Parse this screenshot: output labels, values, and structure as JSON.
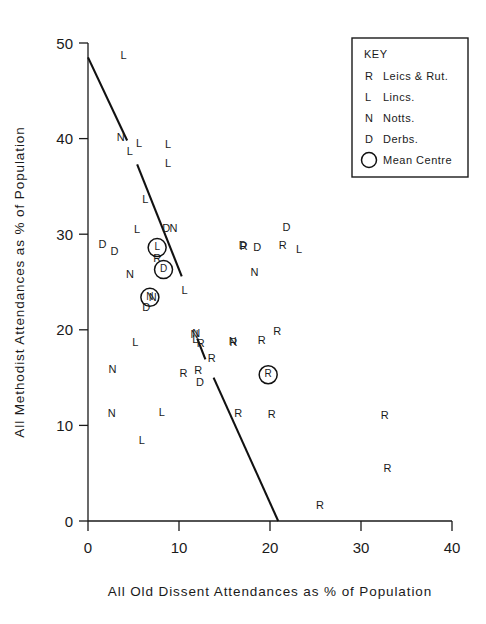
{
  "chart_data": {
    "type": "scatter",
    "title": "",
    "xlabel": "All Old Dissent Attendances as % of Population",
    "ylabel": "All Methodist Attendances as % of Population",
    "xlim": [
      0,
      40
    ],
    "ylim": [
      0,
      50
    ],
    "xticks": [
      0,
      10,
      20,
      30,
      40
    ],
    "yticks": [
      0,
      10,
      20,
      30,
      40,
      50
    ],
    "xtick_labels": [
      "0",
      "10",
      "20",
      "30",
      "40"
    ],
    "ytick_labels": [
      "0",
      "10",
      "20",
      "30",
      "40",
      "50"
    ],
    "grid": false,
    "marker_style": "letter-coded by county",
    "series": [
      {
        "name": "Leics & Rut.",
        "code": "R",
        "points": [
          [
            7.6,
            27.4
          ],
          [
            17.1,
            28.6
          ],
          [
            21.4,
            28.8
          ],
          [
            13.6,
            16.9
          ],
          [
            16.0,
            18.6
          ],
          [
            19.1,
            18.8
          ],
          [
            20.8,
            19.8
          ],
          [
            12.1,
            15.7
          ],
          [
            12.4,
            18.5
          ],
          [
            10.5,
            15.4
          ],
          [
            16.5,
            11.2
          ],
          [
            20.2,
            11.1
          ],
          [
            32.6,
            11.0
          ],
          [
            32.9,
            5.4
          ],
          [
            25.5,
            1.6
          ]
        ]
      },
      {
        "name": "Lincs.",
        "code": "L",
        "points": [
          [
            3.9,
            48.6
          ],
          [
            4.6,
            38.6
          ],
          [
            5.6,
            39.4
          ],
          [
            8.8,
            39.3
          ],
          [
            8.8,
            37.3
          ],
          [
            6.3,
            33.6
          ],
          [
            5.4,
            30.4
          ],
          [
            10.6,
            24.1
          ],
          [
            23.2,
            28.3
          ],
          [
            5.2,
            18.6
          ],
          [
            11.8,
            18.9
          ],
          [
            8.1,
            11.3
          ],
          [
            5.9,
            8.4
          ]
        ]
      },
      {
        "name": "Notts.",
        "code": "N",
        "points": [
          [
            3.6,
            40.1
          ],
          [
            9.4,
            30.5
          ],
          [
            4.6,
            25.7
          ],
          [
            7.1,
            23.3
          ],
          [
            18.3,
            25.9
          ],
          [
            11.9,
            19.5
          ],
          [
            2.7,
            15.8
          ],
          [
            2.6,
            11.2
          ],
          [
            11.7,
            19.4
          ],
          [
            15.9,
            18.7
          ]
        ]
      },
      {
        "name": "Derbs.",
        "code": "D",
        "points": [
          [
            8.6,
            30.5
          ],
          [
            1.6,
            28.9
          ],
          [
            2.9,
            28.1
          ],
          [
            17.0,
            28.8
          ],
          [
            18.6,
            28.5
          ],
          [
            21.8,
            30.6
          ],
          [
            6.4,
            22.3
          ],
          [
            12.3,
            14.4
          ]
        ]
      }
    ],
    "mean_centres": [
      {
        "code": "L",
        "name": "Lincs. mean centre",
        "x": 7.6,
        "y": 28.6
      },
      {
        "code": "D",
        "name": "Derbs. mean centre",
        "x": 8.3,
        "y": 26.3
      },
      {
        "code": "N",
        "name": "Notts. mean centre",
        "x": 6.8,
        "y": 23.4
      },
      {
        "code": "R",
        "name": "Leics & Rut. mean centre",
        "x": 19.8,
        "y": 15.3
      }
    ],
    "trend_lines": [
      {
        "name": "upper-segment",
        "x1": 0.0,
        "y1": 48.5,
        "x2": 4.3,
        "y2": 39.8
      },
      {
        "name": "middle-segment",
        "x1": 5.4,
        "y1": 37.3,
        "x2": 10.3,
        "y2": 25.6
      },
      {
        "name": "lower-upper-segment",
        "x1": 12.0,
        "y1": 19.1,
        "x2": 12.9,
        "y2": 16.9
      },
      {
        "name": "lower-segment",
        "x1": 13.8,
        "y1": 15.0,
        "x2": 20.9,
        "y2": 0.0
      }
    ],
    "annotations": []
  },
  "legend": {
    "title": "KEY",
    "position": "top-right",
    "entries": [
      {
        "symbol": "R",
        "label": "Leics & Rut."
      },
      {
        "symbol": "L",
        "label": "Lincs."
      },
      {
        "symbol": "N",
        "label": "Notts."
      },
      {
        "symbol": "D",
        "label": "Derbs."
      },
      {
        "symbol": "circle",
        "label": "Mean Centre"
      }
    ]
  },
  "colors": {
    "ink": "#1a1a1a",
    "background": "#ffffff",
    "trend": "#111111"
  }
}
